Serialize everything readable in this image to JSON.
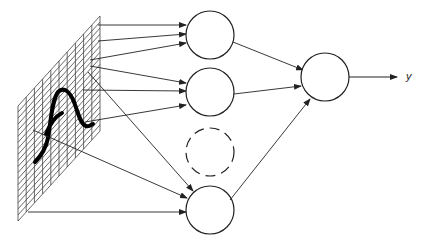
{
  "diagram": {
    "type": "neural-network",
    "colors": {
      "stroke": "#333333",
      "curve": "#000000",
      "background": "#ffffff"
    },
    "input_grid": {
      "shape": "parallelogram",
      "corners": {
        "top_left": [
          18,
          106
        ],
        "top_right": [
          100,
          16
        ],
        "bottom_right": [
          100,
          131
        ],
        "bottom_left": [
          18,
          221
        ]
      },
      "columns": 10,
      "rows": 19,
      "glyph": "handwritten-curve"
    },
    "hidden_layer": {
      "nodes": [
        {
          "id": "h1",
          "cx": 210,
          "cy": 35,
          "r": 24,
          "style": "solid"
        },
        {
          "id": "h2",
          "cx": 210,
          "cy": 92,
          "r": 24,
          "style": "solid"
        },
        {
          "id": "h3",
          "cx": 210,
          "cy": 152,
          "r": 24,
          "style": "dashed"
        },
        {
          "id": "h4",
          "cx": 210,
          "cy": 210,
          "r": 24,
          "style": "solid"
        }
      ]
    },
    "output_node": {
      "id": "out",
      "cx": 325,
      "cy": 77,
      "r": 24,
      "style": "solid"
    },
    "input_connections": [
      {
        "from": [
          98,
          25
        ],
        "to": [
          186,
          25
        ],
        "target": "h1"
      },
      {
        "from": [
          98,
          41
        ],
        "to": [
          186,
          34
        ],
        "target": "h1"
      },
      {
        "from": [
          90,
          60
        ],
        "to": [
          186,
          43
        ],
        "target": "h1"
      },
      {
        "from": [
          90,
          66
        ],
        "to": [
          186,
          83
        ],
        "target": "h2"
      },
      {
        "from": [
          83,
          90
        ],
        "to": [
          186,
          91
        ],
        "target": "h2"
      },
      {
        "from": [
          85,
          122
        ],
        "to": [
          186,
          105
        ],
        "target": "h2"
      },
      {
        "from": [
          88,
          72
        ],
        "to": [
          193,
          191
        ],
        "target": "h4"
      },
      {
        "from": [
          33,
          130
        ],
        "to": [
          187,
          198
        ],
        "target": "h4"
      },
      {
        "from": [
          28,
          212
        ],
        "to": [
          186,
          212
        ],
        "target": "h4"
      }
    ],
    "hidden_to_output": [
      {
        "from": [
          233,
          42
        ],
        "to": [
          303,
          70
        ],
        "source": "h1"
      },
      {
        "from": [
          234,
          94
        ],
        "to": [
          301,
          86
        ],
        "source": "h2"
      },
      {
        "from": [
          230,
          200
        ],
        "to": [
          310,
          99
        ],
        "source": "h4"
      }
    ],
    "output_arrow": {
      "from": [
        349,
        77
      ],
      "to": [
        397,
        77
      ]
    },
    "output_label": "y"
  }
}
